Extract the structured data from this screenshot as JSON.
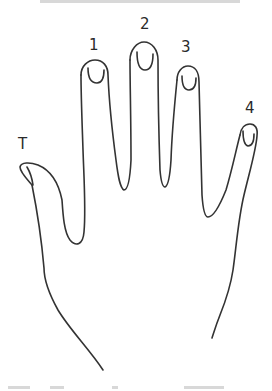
{
  "diagram": {
    "type": "hand-outline",
    "stroke_color": "#333333",
    "background": "#ffffff",
    "labels": [
      {
        "id": "thumb",
        "text": "T",
        "x": 18,
        "y": 137
      },
      {
        "id": "finger-1",
        "text": "1",
        "x": 89,
        "y": 38
      },
      {
        "id": "finger-2",
        "text": "2",
        "x": 140,
        "y": 17
      },
      {
        "id": "finger-3",
        "text": "3",
        "x": 181,
        "y": 40
      },
      {
        "id": "finger-4",
        "text": "4",
        "x": 245,
        "y": 101
      }
    ]
  },
  "cut_off_text": {
    "top": "",
    "bottom": ""
  }
}
